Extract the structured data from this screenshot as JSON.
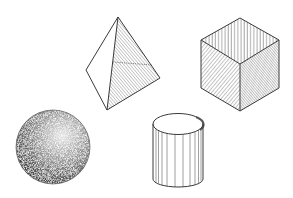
{
  "figure": {
    "background": "#ffffff",
    "stroke_color": "#3a3a3a",
    "hatch_color": "#555555",
    "shapes": [
      {
        "name": "tetrahedron",
        "shading": "diagonal-hatch"
      },
      {
        "name": "cube",
        "shading": "vertical-and-diagonal-hatch"
      },
      {
        "name": "sphere",
        "shading": "stipple"
      },
      {
        "name": "cylinder",
        "shading": "vertical-lines"
      }
    ]
  }
}
